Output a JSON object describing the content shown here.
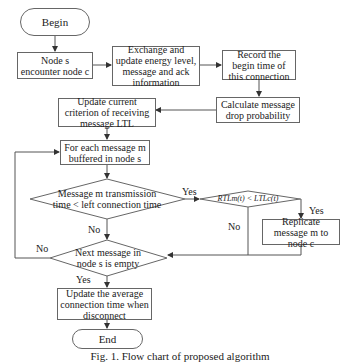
{
  "diagram": {
    "type": "flowchart",
    "nodes": {
      "begin": "Begin",
      "encounter": [
        "Node s",
        "encounter node c"
      ],
      "exchange": "Exchange and update energy level, message and ack information",
      "record": "Record the begin time of this connection",
      "calculate": "Calculate message drop probability",
      "update_ltl": "Update current criterion of receiving message LTL",
      "for_each": "For each message m buffered in node s",
      "decision_time": "Message m transmission time < left connection time",
      "decision_rtl": "RTLm(t) < LTLc(t)",
      "replicate": "Replicate message m to node c",
      "decision_empty": "Next message in node s is empty",
      "update_avg": "Update the average connection time when disconnect",
      "end": "End"
    },
    "edge_labels": {
      "time_yes": "Yes",
      "time_no": "No",
      "rtl_yes": "Yes",
      "rtl_no": "No",
      "empty_no": "No",
      "empty_yes": "Yes"
    },
    "caption": "Fig. 1. Flow chart of proposed algorithm"
  }
}
